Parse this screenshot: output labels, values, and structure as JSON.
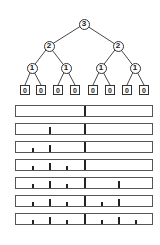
{
  "tree": {
    "nodes": [
      {
        "id": "root",
        "label": "3",
        "x": 84,
        "y": 24,
        "kind": "circle"
      },
      {
        "id": "l2a",
        "label": "2",
        "x": 49,
        "y": 46,
        "kind": "circle"
      },
      {
        "id": "l2b",
        "label": "2",
        "x": 118,
        "y": 46,
        "kind": "circle"
      },
      {
        "id": "l3a",
        "label": "1",
        "x": 32,
        "y": 68,
        "kind": "circle"
      },
      {
        "id": "l3b",
        "label": "1",
        "x": 66,
        "y": 68,
        "kind": "circle"
      },
      {
        "id": "l3c",
        "label": "1",
        "x": 101,
        "y": 68,
        "kind": "circle"
      },
      {
        "id": "l3d",
        "label": "1",
        "x": 135,
        "y": 68,
        "kind": "circle"
      },
      {
        "id": "f1",
        "label": "0",
        "x": 25,
        "y": 90,
        "kind": "box"
      },
      {
        "id": "f2",
        "label": "0",
        "x": 41,
        "y": 90,
        "kind": "box"
      },
      {
        "id": "f3",
        "label": "0",
        "x": 58,
        "y": 90,
        "kind": "box"
      },
      {
        "id": "f4",
        "label": "0",
        "x": 75,
        "y": 90,
        "kind": "box"
      },
      {
        "id": "f5",
        "label": "0",
        "x": 93,
        "y": 90,
        "kind": "box"
      },
      {
        "id": "f6",
        "label": "0",
        "x": 110,
        "y": 90,
        "kind": "box"
      },
      {
        "id": "f7",
        "label": "0",
        "x": 127,
        "y": 90,
        "kind": "box"
      },
      {
        "id": "f8",
        "label": "0",
        "x": 144,
        "y": 90,
        "kind": "box"
      }
    ],
    "edges": [
      [
        "root",
        "l2a"
      ],
      [
        "root",
        "l2b"
      ],
      [
        "l2a",
        "l3a"
      ],
      [
        "l2a",
        "l3b"
      ],
      [
        "l2b",
        "l3c"
      ],
      [
        "l2b",
        "l3d"
      ],
      [
        "l3a",
        "f1"
      ],
      [
        "l3a",
        "f2"
      ],
      [
        "l3b",
        "f3"
      ],
      [
        "l3b",
        "f4"
      ],
      [
        "l3c",
        "f5"
      ],
      [
        "l3c",
        "f6"
      ],
      [
        "l3d",
        "f7"
      ],
      [
        "l3d",
        "f8"
      ]
    ]
  },
  "ruler_bars": {
    "count": 7,
    "tick_sizes": {
      "tall": 10,
      "mid": 7,
      "short": 4
    },
    "tick_positions": {
      "84": "tall",
      "49": "mid",
      "118": "mid",
      "32": "short",
      "66": "short",
      "101": "short",
      "135": "short"
    },
    "rows": [
      {
        "top": 105,
        "ticks": [
          84
        ]
      },
      {
        "top": 123,
        "ticks": [
          84,
          49
        ]
      },
      {
        "top": 141,
        "ticks": [
          84,
          49,
          32
        ]
      },
      {
        "top": 159,
        "ticks": [
          84,
          49,
          32,
          66
        ]
      },
      {
        "top": 177,
        "ticks": [
          84,
          49,
          32,
          66,
          118
        ]
      },
      {
        "top": 195,
        "ticks": [
          84,
          49,
          32,
          66,
          118,
          101
        ]
      },
      {
        "top": 213,
        "ticks": [
          84,
          49,
          32,
          66,
          118,
          101,
          135
        ]
      }
    ]
  },
  "colors": {
    "stroke": "#333333",
    "tick": "#222222",
    "bar_border": "#555555"
  }
}
